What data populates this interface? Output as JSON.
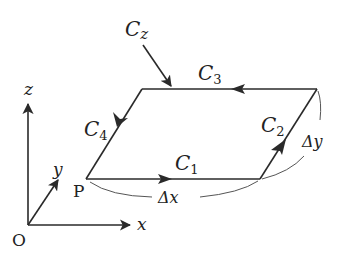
{
  "diagram": {
    "type": "circulation-loop-parallelogram",
    "labels": {
      "cz": "C",
      "cz_sub": "z",
      "c1": "C",
      "c1_sub": "1",
      "c2": "C",
      "c2_sub": "2",
      "c3": "C",
      "c3_sub": "3",
      "c4": "C",
      "c4_sub": "4",
      "point_p": "P",
      "origin": "O",
      "axis_x": "x",
      "axis_y": "y",
      "axis_z": "z",
      "delta_x": "Δx",
      "delta_y": "Δy"
    },
    "nodes": [
      {
        "id": "P",
        "label": "P"
      },
      {
        "id": "O",
        "label": "O"
      }
    ],
    "edges": [
      {
        "id": "C1",
        "from": "P",
        "to": "bottom-right",
        "direction": "+x"
      },
      {
        "id": "C2",
        "from": "bottom-right",
        "to": "top-right",
        "direction": "+y"
      },
      {
        "id": "C3",
        "from": "top-right",
        "to": "top-left",
        "direction": "-x"
      },
      {
        "id": "C4",
        "from": "top-left",
        "to": "P",
        "direction": "-y"
      }
    ],
    "colors": {
      "line": "#2a2a2a",
      "text": "#222222",
      "background": "#ffffff"
    }
  }
}
